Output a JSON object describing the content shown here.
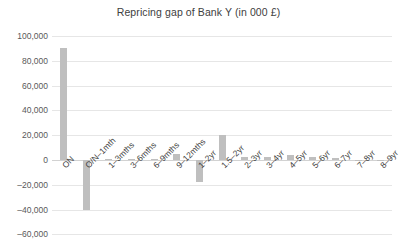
{
  "chart_data": {
    "type": "bar",
    "title": "Repricing gap of Bank Y (in 000 £)",
    "xlabel": "",
    "ylabel": "",
    "ylim": [
      -60000,
      100000
    ],
    "ytick_step": 20000,
    "grid": true,
    "legend": "none",
    "bar_color": "#bfbfbf",
    "categories": [
      "ON",
      "O/N–1mth",
      "1–3mths",
      "3–6mths",
      "6–9mths",
      "9–12mths",
      "1–2yr",
      "1.5–2yr",
      "2–3yr",
      "3–4yr",
      "4–5yr",
      "5–6yr",
      "6–7yr",
      "7–8yr",
      "8–9yr"
    ],
    "values": [
      90000,
      -40000,
      500,
      1200,
      800,
      4500,
      -18000,
      20000,
      2500,
      2200,
      4000,
      2200,
      2000,
      300,
      200
    ],
    "ytick_labels": [
      "100,000",
      "80,000",
      "60,000",
      "40,000",
      "20,000",
      "0",
      "–20,000",
      "–40,000",
      "–60,000"
    ],
    "ytick_values": [
      100000,
      80000,
      60000,
      40000,
      20000,
      0,
      -20000,
      -40000,
      -60000
    ]
  }
}
